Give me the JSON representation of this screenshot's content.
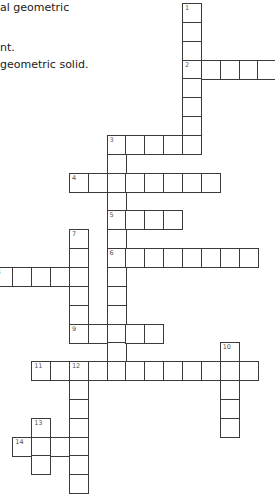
{
  "clues_visible": [
    {
      "text": "al geometric",
      "top": 0
    },
    {
      "text": "nt.",
      "top": 40
    },
    {
      "text": "geometric solid.",
      "top": 57
    }
  ],
  "grid": {
    "origin_x": 182,
    "origin_y": 3,
    "pitch": 18.85,
    "words": [
      {
        "number": 1,
        "direction": "down",
        "col": 0,
        "row": 0,
        "length": 8
      },
      {
        "number": 2,
        "direction": "across",
        "col": 0,
        "row": 3,
        "length": 5
      },
      {
        "number": 3,
        "direction": "across",
        "col": -4,
        "row": 7,
        "length": 5
      },
      {
        "number": 3,
        "direction": "down",
        "col": -4,
        "row": 7,
        "length": 13
      },
      {
        "number": 4,
        "direction": "across",
        "col": -6,
        "row": 9,
        "length": 8
      },
      {
        "number": 5,
        "direction": "across",
        "col": -4,
        "row": 11,
        "length": 4
      },
      {
        "number": 6,
        "direction": "across",
        "col": -4,
        "row": 13,
        "length": 8
      },
      {
        "number": 7,
        "direction": "down",
        "col": -6,
        "row": 12,
        "length": 6
      },
      {
        "number": 8,
        "direction": "across",
        "col": -10,
        "row": 14,
        "length": 5
      },
      {
        "number": 9,
        "direction": "across",
        "col": -6,
        "row": 17,
        "length": 5
      },
      {
        "number": 10,
        "direction": "down",
        "col": 2,
        "row": 18,
        "length": 5
      },
      {
        "number": 11,
        "direction": "across",
        "col": -8,
        "row": 19,
        "length": 12
      },
      {
        "number": 12,
        "direction": "down",
        "col": -6,
        "row": 19,
        "length": 7
      },
      {
        "number": 13,
        "direction": "down",
        "col": -8,
        "row": 22,
        "length": 3
      },
      {
        "number": 14,
        "direction": "across",
        "col": -9,
        "row": 23,
        "length": 4
      }
    ]
  }
}
